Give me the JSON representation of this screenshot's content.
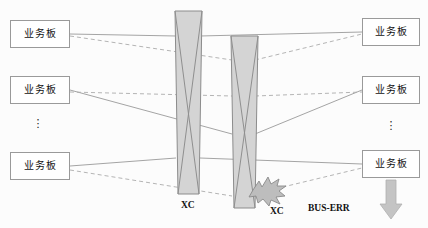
{
  "diagram": {
    "colors": {
      "board_border": "#9a9a9a",
      "board_fill": "#ffffff",
      "xc_fill": "#d4d4d4",
      "xc_border": "#8c8c8c",
      "cross_line": "#8f8f8f",
      "solid_link": "#9a9a9a",
      "dashed_link": "#a9a9a9",
      "burst_fill": "#bdbdbd",
      "burst_border": "#8a8a8a",
      "arrow_fill": "#c4c4c4",
      "arrow_border": "#aaaaaa",
      "text": "#111111",
      "background": "#fcfcfc"
    },
    "left_boards": [
      {
        "label": "业务板"
      },
      {
        "label": "业务板"
      },
      {
        "label": "业务板"
      }
    ],
    "right_boards": [
      {
        "label": "业务板"
      },
      {
        "label": "业务板"
      },
      {
        "label": "业务板"
      }
    ],
    "left_ellipsis": "⋮",
    "right_ellipsis": "⋮",
    "switch_boards": [
      {
        "label": "XC"
      },
      {
        "label": "XC"
      }
    ],
    "fault": {
      "marker": "burst-icon",
      "label": "BUS-ERR"
    },
    "arrow": {
      "direction": "down",
      "name": "down-arrow-icon"
    }
  }
}
